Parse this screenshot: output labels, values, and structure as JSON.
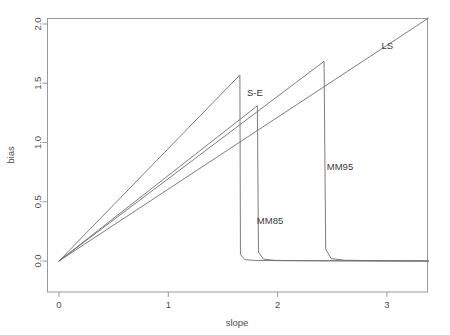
{
  "chart_data": {
    "type": "line",
    "title": "",
    "subtitle": "",
    "xlabel": "slope",
    "ylabel": "bias",
    "xlim": [
      -0.08,
      3.42
    ],
    "ylim": [
      -0.06,
      2.12
    ],
    "xticks": [
      0,
      1,
      2,
      3
    ],
    "xticklabels": [
      "0",
      "1",
      "2",
      "3"
    ],
    "yticks": [
      0.0,
      0.5,
      1.0,
      1.5,
      2.0
    ],
    "yticklabels": [
      "0.0",
      "0.5",
      "1.0",
      "1.5",
      "2.0"
    ],
    "grid": false,
    "legend": "inline-annotations",
    "line_color": "#6e6e6e",
    "axis_color": "#8a8a8a",
    "series": [
      {
        "name": "LS",
        "label": "LS",
        "label_x": 2.95,
        "label_y": 1.82,
        "points": [
          [
            0.0,
            0.0
          ],
          [
            3.38,
            2.05
          ]
        ]
      },
      {
        "name": "S-E",
        "label": "S-E",
        "label_x": 1.72,
        "label_y": 1.42,
        "points": [
          [
            0.0,
            0.0
          ],
          [
            1.655,
            1.57
          ],
          [
            1.66,
            0.055
          ],
          [
            1.7,
            0.012
          ],
          [
            1.8,
            0.004
          ],
          [
            2.2,
            0.002
          ],
          [
            3.38,
            0.0
          ]
        ]
      },
      {
        "name": "MM85",
        "label": "MM85",
        "label_x": 1.81,
        "label_y": 0.345,
        "points": [
          [
            0.0,
            0.0
          ],
          [
            1.815,
            1.31
          ],
          [
            1.825,
            0.075
          ],
          [
            1.87,
            0.016
          ],
          [
            1.98,
            0.005
          ],
          [
            2.4,
            0.002
          ],
          [
            3.38,
            0.0
          ]
        ]
      },
      {
        "name": "MM95",
        "label": "MM95",
        "label_x": 2.45,
        "label_y": 0.795,
        "points": [
          [
            0.0,
            0.0
          ],
          [
            2.425,
            1.685
          ],
          [
            2.44,
            0.1
          ],
          [
            2.49,
            0.02
          ],
          [
            2.62,
            0.006
          ],
          [
            3.0,
            0.002
          ],
          [
            3.38,
            0.0
          ]
        ]
      }
    ]
  }
}
